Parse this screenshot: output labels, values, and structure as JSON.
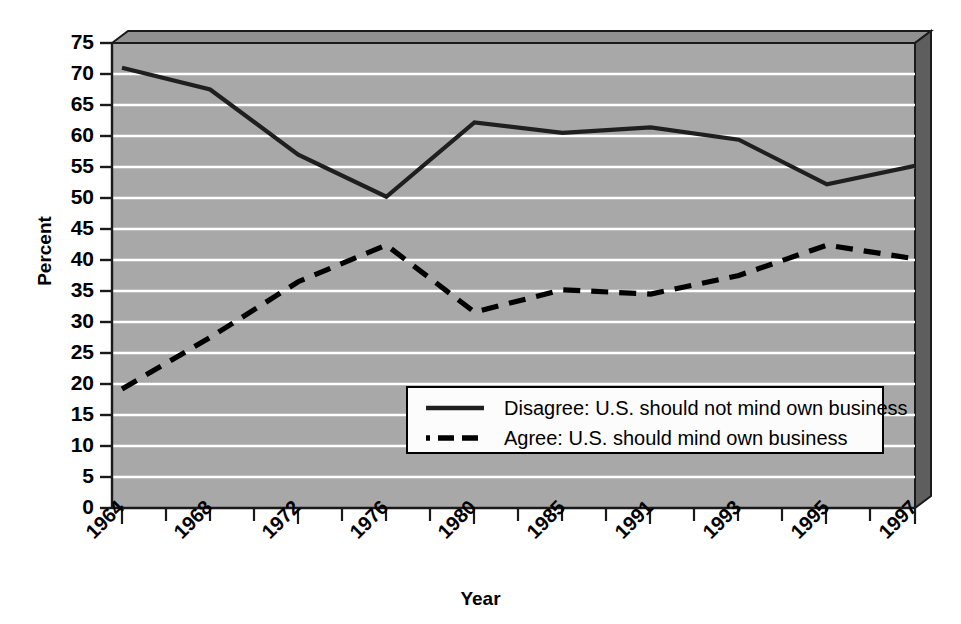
{
  "chart_data": {
    "type": "line",
    "title": "",
    "xlabel": "Year",
    "ylabel": "Percent",
    "ylim": [
      0,
      75
    ],
    "yticks": [
      0,
      5,
      10,
      15,
      20,
      25,
      30,
      35,
      40,
      45,
      50,
      55,
      60,
      65,
      70,
      75
    ],
    "grid": "horizontal-white-gridlines",
    "legend_position": "inside-lower-center",
    "categories": [
      "1964",
      "1968",
      "1972",
      "1976",
      "1980",
      "1985",
      "1991",
      "1993",
      "1995",
      "1997"
    ],
    "series": [
      {
        "name": "Disagree: U.S. should not mind own business",
        "style": "solid",
        "color": "#1f1f1f",
        "values": [
          71.0,
          67.5,
          57.0,
          50.2,
          62.2,
          60.5,
          61.4,
          59.4,
          52.2,
          55.2
        ]
      },
      {
        "name": "Agree: U.S. should mind own business",
        "style": "dashed",
        "color": "#000000",
        "values": [
          19.2,
          27.5,
          36.5,
          42.4,
          31.6,
          35.2,
          34.5,
          37.5,
          42.4,
          40.2
        ]
      }
    ]
  },
  "axes": {
    "y_label": "Percent",
    "x_label": "Year",
    "y_tick_labels": [
      "75",
      "70",
      "65",
      "60",
      "55",
      "50",
      "45",
      "40",
      "35",
      "30",
      "25",
      "20",
      "15",
      "10",
      "5",
      "0"
    ],
    "x_tick_labels": [
      "1964",
      "1968",
      "1972",
      "1976",
      "1980",
      "1985",
      "1991",
      "1993",
      "1995",
      "1997"
    ]
  },
  "legend": {
    "entries": [
      {
        "label": "Disagree: U.S. should not mind own business",
        "style": "solid"
      },
      {
        "label": "Agree: U.S. should mind own business",
        "style": "dashed"
      }
    ]
  },
  "colors": {
    "plot_background": "#a8a8a8",
    "gridline": "#ffffff",
    "frame": "#1a1a1a",
    "bevel_dark": "#5a5a5a",
    "bevel_mid": "#8a8a8a",
    "series_solid": "#1f1f1f",
    "series_dashed": "#000000",
    "legend_background": "#fcfcfc",
    "page_background": "#ffffff"
  }
}
